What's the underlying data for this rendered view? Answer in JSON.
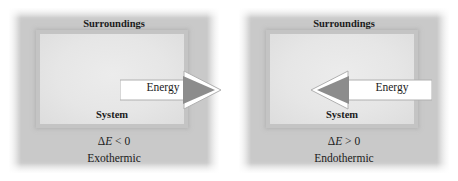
{
  "figure": {
    "colors": {
      "surroundings_fill": "#c9c9c9",
      "system_fill": "#e3e3e3",
      "system_border": "#c4c4c4",
      "arrow_head": "#8c8c8c",
      "arrow_body": "#ffffff",
      "text": "#1b1b1b",
      "background": "#ffffff"
    },
    "panels": [
      {
        "id": "exothermic",
        "surroundings_label": "Surroundings",
        "system_label": "System",
        "delta_symbol": "Δ",
        "delta_variable": "E",
        "delta_relation": "< 0",
        "delta_full": "ΔE < 0",
        "process_label": "Exothermic",
        "arrow": {
          "label": "Energy",
          "direction": "right",
          "meaning": "energy flows from system to surroundings",
          "head_color": "#8c8c8c",
          "body_color": "#ffffff"
        }
      },
      {
        "id": "endothermic",
        "surroundings_label": "Surroundings",
        "system_label": "System",
        "delta_symbol": "Δ",
        "delta_variable": "E",
        "delta_relation": "> 0",
        "delta_full": "ΔE > 0",
        "process_label": "Endothermic",
        "arrow": {
          "label": "Energy",
          "direction": "left",
          "meaning": "energy flows from surroundings into system",
          "head_color": "#8c8c8c",
          "body_color": "#ffffff"
        }
      }
    ]
  }
}
